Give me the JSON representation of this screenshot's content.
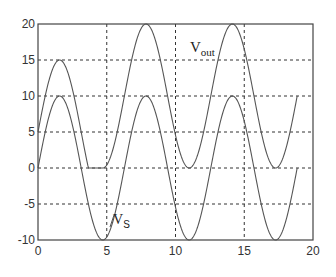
{
  "chart_data": {
    "type": "line",
    "title": "",
    "xlabel": "",
    "ylabel": "",
    "xlim": [
      0,
      20
    ],
    "ylim": [
      -10,
      20
    ],
    "grid": true,
    "legend": "none",
    "x_ticks": [
      0,
      5,
      10,
      15,
      20
    ],
    "y_ticks": [
      -10,
      -5,
      0,
      5,
      10,
      15,
      20
    ],
    "x_tick_labels": [
      "0",
      "5",
      "10",
      "15",
      "20"
    ],
    "y_tick_labels": [
      "-10",
      "-5",
      "0",
      "5",
      "10",
      "15",
      "20"
    ],
    "series": [
      {
        "name": "vs",
        "description": "10*sin(t), t from 0 to 6*pi",
        "x": [
          0,
          1.57,
          3.14,
          4.71,
          6.28,
          7.85,
          9.42,
          11.0,
          12.57,
          14.14,
          15.71,
          17.28,
          18.85
        ],
        "values": [
          0,
          10,
          0,
          -10,
          0,
          10,
          0,
          -10,
          0,
          10,
          0,
          -10,
          0
        ]
      },
      {
        "name": "vout",
        "description": "vs+5 until clipped at 0 (t≈3.67 to 4.71), then vs+10",
        "x": [
          0,
          1.57,
          3.14,
          3.67,
          4.71,
          6.28,
          7.85,
          9.42,
          11.0,
          12.57,
          14.14,
          15.71,
          17.28,
          18.85
        ],
        "values": [
          5,
          15,
          5,
          0,
          0,
          10,
          20,
          10,
          0,
          10,
          20,
          10,
          0,
          10
        ]
      }
    ],
    "annotations": [
      {
        "text": "V",
        "sub": "out",
        "x": 12.1,
        "y": 16.8
      },
      {
        "text": "V",
        "sub": "S",
        "x": 5.4,
        "y": -8.0
      }
    ]
  },
  "labels": {
    "vout_main": "V",
    "vout_sub": "out",
    "vs_main": "V",
    "vs_sub": "S"
  }
}
